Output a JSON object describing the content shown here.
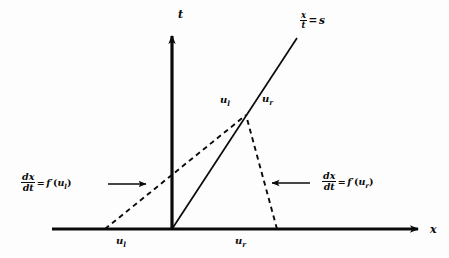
{
  "figure": {
    "name": "shock-wave-characteristics-diagram",
    "background_color": "#fdfdfd",
    "ink_color": "#0a0a0a"
  },
  "axes": {
    "x_axis_label": "x",
    "t_axis_label": "t",
    "origin": {
      "x": 172,
      "y": 229
    },
    "x_axis": {
      "x1": 52,
      "y1": 229,
      "x2": 425,
      "y2": 229
    },
    "t_axis": {
      "x1": 172,
      "y1": 229,
      "x2": 172,
      "y2": 28
    }
  },
  "shock_line": {
    "label_numerator": "x",
    "label_denominator": "t",
    "equals": "=",
    "label_value": "s",
    "from": {
      "x": 172,
      "y": 229
    },
    "to": {
      "x": 297,
      "y": 38
    }
  },
  "characteristics": {
    "left": {
      "style": "dashed",
      "from": {
        "x": 105,
        "y": 229
      },
      "to": {
        "x": 246,
        "y": 115
      }
    },
    "right": {
      "style": "dashed",
      "from": {
        "x": 277,
        "y": 229
      },
      "to": {
        "x": 246,
        "y": 115
      }
    }
  },
  "intersection_point": {
    "x": 246,
    "y": 115
  },
  "state_labels": {
    "upper_left": {
      "base": "u",
      "sub": "l"
    },
    "upper_right": {
      "base": "u",
      "sub": "r"
    },
    "axis_left": {
      "base": "u",
      "sub": "l"
    },
    "axis_right": {
      "base": "u",
      "sub": "r"
    }
  },
  "annotations": {
    "left": {
      "num": "dx",
      "den": "dt",
      "equals": "=",
      "func": "f",
      "prime": "′",
      "open": "(",
      "arg_base": "u",
      "arg_sub": "l",
      "close": ")",
      "arrow_direction": "right"
    },
    "right": {
      "num": "dx",
      "den": "dt",
      "equals": "=",
      "func": "f",
      "prime": "′",
      "open": "(",
      "arg_base": "u",
      "arg_sub": "r",
      "close": ")",
      "arrow_direction": "left"
    }
  }
}
